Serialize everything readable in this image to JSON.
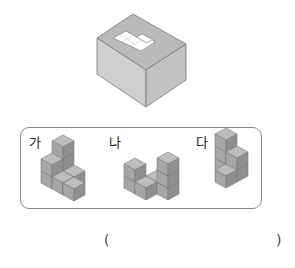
{
  "problem_figure": {
    "description": "box with L-shaped hole on top",
    "colors": {
      "top": "#b9b9b9",
      "left": "#c9c9c9",
      "right": "#a9a9a9",
      "hole": "#ffffff",
      "edge": "#6f6f6f"
    }
  },
  "options": [
    {
      "label": "가",
      "name": "option-ga"
    },
    {
      "label": "나",
      "name": "option-na"
    },
    {
      "label": "다",
      "name": "option-da"
    }
  ],
  "cube_colors": {
    "top": "#bdbdbd",
    "left": "#a6a6a6",
    "right": "#8f8f8f",
    "edge": "#7a7a7a"
  },
  "answer": {
    "open": "(",
    "close": ")",
    "value": ""
  }
}
